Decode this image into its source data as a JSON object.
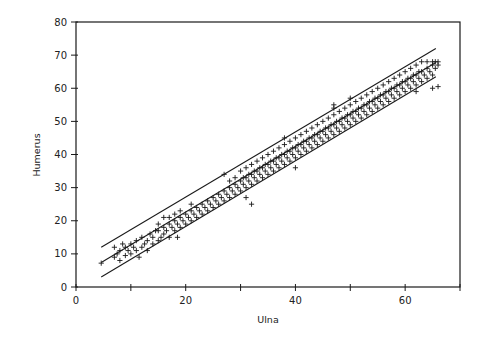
{
  "chart_data": {
    "type": "scatter",
    "title": "",
    "xlabel": "Ulna",
    "ylabel": "Humerus",
    "xlim": [
      0,
      70
    ],
    "ylim": [
      0,
      80
    ],
    "xticks": [
      0,
      10,
      20,
      30,
      40,
      50,
      60,
      70
    ],
    "xtick_labels": [
      "0",
      "",
      "20",
      "",
      "40",
      "",
      "60",
      ""
    ],
    "yticks": [
      0,
      10,
      20,
      30,
      40,
      50,
      60,
      70,
      80
    ],
    "ytick_labels": [
      "0",
      "10",
      "20",
      "30",
      "40",
      "50",
      "60",
      "70",
      "80"
    ],
    "grid": false,
    "legend": null,
    "marker": "+",
    "lines": [
      {
        "name": "regression-line",
        "x": [
          4.6,
          65.6
        ],
        "y": [
          7.4,
          67.8
        ]
      },
      {
        "name": "upper-band",
        "x": [
          4.6,
          65.6
        ],
        "y": [
          12.0,
          72.0
        ]
      },
      {
        "name": "lower-band",
        "x": [
          4.6,
          65.6
        ],
        "y": [
          3.0,
          63.5
        ]
      }
    ],
    "points": [
      [
        4.6,
        7.2
      ],
      [
        7,
        9
      ],
      [
        7,
        12
      ],
      [
        7.5,
        10
      ],
      [
        8,
        8
      ],
      [
        8,
        11
      ],
      [
        8.5,
        13
      ],
      [
        9,
        9.5
      ],
      [
        9,
        12
      ],
      [
        9.5,
        11
      ],
      [
        10,
        10
      ],
      [
        10,
        13
      ],
      [
        10.5,
        12
      ],
      [
        11,
        11
      ],
      [
        11,
        14
      ],
      [
        11.5,
        9
      ],
      [
        12,
        12
      ],
      [
        12,
        15
      ],
      [
        12.5,
        13
      ],
      [
        13,
        11
      ],
      [
        13,
        14
      ],
      [
        13.5,
        16
      ],
      [
        14,
        13
      ],
      [
        14,
        15
      ],
      [
        14.5,
        17
      ],
      [
        15,
        14
      ],
      [
        15,
        17
      ],
      [
        15,
        19
      ],
      [
        15.5,
        15
      ],
      [
        16,
        16
      ],
      [
        16,
        18
      ],
      [
        16,
        21
      ],
      [
        16.5,
        17
      ],
      [
        17,
        15
      ],
      [
        17,
        19
      ],
      [
        17,
        21
      ],
      [
        17.5,
        18
      ],
      [
        18,
        17
      ],
      [
        18,
        20
      ],
      [
        18,
        22
      ],
      [
        18.5,
        15
      ],
      [
        18.5,
        19
      ],
      [
        19,
        18
      ],
      [
        19,
        21
      ],
      [
        19,
        23
      ],
      [
        19.5,
        20
      ],
      [
        20,
        19
      ],
      [
        20,
        22
      ],
      [
        20.5,
        21
      ],
      [
        21,
        20
      ],
      [
        21,
        23
      ],
      [
        21,
        25
      ],
      [
        21.5,
        22
      ],
      [
        22,
        21
      ],
      [
        22,
        24
      ],
      [
        22.5,
        23
      ],
      [
        23,
        22
      ],
      [
        23,
        25
      ],
      [
        23.5,
        24
      ],
      [
        24,
        23
      ],
      [
        24,
        26
      ],
      [
        24.5,
        25
      ],
      [
        25,
        24
      ],
      [
        25,
        27
      ],
      [
        25.5,
        26
      ],
      [
        26,
        25
      ],
      [
        26,
        28
      ],
      [
        26.5,
        27
      ],
      [
        27,
        26
      ],
      [
        27,
        29
      ],
      [
        27,
        34
      ],
      [
        27.5,
        28
      ],
      [
        28,
        27
      ],
      [
        28,
        30
      ],
      [
        28,
        32
      ],
      [
        28.5,
        29
      ],
      [
        29,
        28
      ],
      [
        29,
        31
      ],
      [
        29,
        33
      ],
      [
        29.5,
        30
      ],
      [
        30,
        29
      ],
      [
        30,
        32
      ],
      [
        30,
        35
      ],
      [
        30.5,
        31
      ],
      [
        30.5,
        33
      ],
      [
        31,
        27
      ],
      [
        31,
        30
      ],
      [
        31,
        33
      ],
      [
        31,
        36
      ],
      [
        31.5,
        32
      ],
      [
        31.5,
        34
      ],
      [
        32,
        25
      ],
      [
        32,
        31
      ],
      [
        32,
        34
      ],
      [
        32,
        37
      ],
      [
        32.5,
        33
      ],
      [
        32.5,
        35
      ],
      [
        33,
        32
      ],
      [
        33,
        35
      ],
      [
        33,
        38
      ],
      [
        33.5,
        34
      ],
      [
        33.5,
        36
      ],
      [
        34,
        33
      ],
      [
        34,
        36
      ],
      [
        34,
        39
      ],
      [
        34.5,
        35
      ],
      [
        34.5,
        37
      ],
      [
        35,
        34
      ],
      [
        35,
        37
      ],
      [
        35,
        40
      ],
      [
        35.5,
        36
      ],
      [
        35.5,
        38
      ],
      [
        36,
        35
      ],
      [
        36,
        38
      ],
      [
        36,
        41
      ],
      [
        36.5,
        37
      ],
      [
        36.5,
        39
      ],
      [
        37,
        36
      ],
      [
        37,
        39
      ],
      [
        37,
        42
      ],
      [
        37.5,
        38
      ],
      [
        37.5,
        40
      ],
      [
        38,
        37
      ],
      [
        38,
        40
      ],
      [
        38,
        43
      ],
      [
        38,
        45
      ],
      [
        38.5,
        39
      ],
      [
        38.5,
        41
      ],
      [
        39,
        38
      ],
      [
        39,
        41
      ],
      [
        39,
        44
      ],
      [
        39.5,
        40
      ],
      [
        39.5,
        42
      ],
      [
        40,
        36
      ],
      [
        40,
        39
      ],
      [
        40,
        42
      ],
      [
        40,
        45
      ],
      [
        40.5,
        41
      ],
      [
        40.5,
        43
      ],
      [
        41,
        40
      ],
      [
        41,
        43
      ],
      [
        41,
        46
      ],
      [
        41.5,
        42
      ],
      [
        41.5,
        44
      ],
      [
        42,
        41
      ],
      [
        42,
        44
      ],
      [
        42,
        47
      ],
      [
        42.5,
        43
      ],
      [
        42.5,
        45
      ],
      [
        43,
        42
      ],
      [
        43,
        45
      ],
      [
        43,
        48
      ],
      [
        43.5,
        44
      ],
      [
        43.5,
        46
      ],
      [
        44,
        43
      ],
      [
        44,
        46
      ],
      [
        44,
        49
      ],
      [
        44.5,
        45
      ],
      [
        44.5,
        47
      ],
      [
        45,
        44
      ],
      [
        45,
        47
      ],
      [
        45,
        50
      ],
      [
        45.5,
        46
      ],
      [
        45.5,
        48
      ],
      [
        46,
        45
      ],
      [
        46,
        48
      ],
      [
        46,
        51
      ],
      [
        46.5,
        47
      ],
      [
        46.5,
        49
      ],
      [
        47,
        46
      ],
      [
        47,
        49
      ],
      [
        47,
        52
      ],
      [
        47,
        54
      ],
      [
        47,
        55
      ],
      [
        47.5,
        48
      ],
      [
        47.5,
        50
      ],
      [
        48,
        47
      ],
      [
        48,
        50
      ],
      [
        48,
        53
      ],
      [
        48.5,
        49
      ],
      [
        48.5,
        51
      ],
      [
        49,
        48
      ],
      [
        49,
        51
      ],
      [
        49,
        54
      ],
      [
        49.5,
        50
      ],
      [
        49.5,
        52
      ],
      [
        50,
        49
      ],
      [
        50,
        52
      ],
      [
        50,
        55
      ],
      [
        50,
        57
      ],
      [
        50.5,
        51
      ],
      [
        50.5,
        53
      ],
      [
        51,
        50
      ],
      [
        51,
        53
      ],
      [
        51,
        56
      ],
      [
        51.5,
        52
      ],
      [
        51.5,
        54
      ],
      [
        52,
        51
      ],
      [
        52,
        54
      ],
      [
        52,
        57
      ],
      [
        52.5,
        53
      ],
      [
        52.5,
        55
      ],
      [
        53,
        52
      ],
      [
        53,
        55
      ],
      [
        53,
        58
      ],
      [
        53.5,
        54
      ],
      [
        53.5,
        56
      ],
      [
        54,
        53
      ],
      [
        54,
        56
      ],
      [
        54,
        59
      ],
      [
        54.5,
        55
      ],
      [
        54.5,
        57
      ],
      [
        55,
        54
      ],
      [
        55,
        57
      ],
      [
        55,
        60
      ],
      [
        55.5,
        56
      ],
      [
        55.5,
        58
      ],
      [
        56,
        55
      ],
      [
        56,
        58
      ],
      [
        56,
        61
      ],
      [
        56.5,
        57
      ],
      [
        56.5,
        59
      ],
      [
        57,
        56
      ],
      [
        57,
        59
      ],
      [
        57,
        62
      ],
      [
        57.5,
        58
      ],
      [
        57.5,
        60
      ],
      [
        58,
        57
      ],
      [
        58,
        60
      ],
      [
        58,
        63
      ],
      [
        58.5,
        59
      ],
      [
        58.5,
        61
      ],
      [
        59,
        58
      ],
      [
        59,
        61
      ],
      [
        59,
        64
      ],
      [
        59.5,
        60
      ],
      [
        59.5,
        62
      ],
      [
        60,
        59
      ],
      [
        60,
        62
      ],
      [
        60,
        65
      ],
      [
        60.5,
        61
      ],
      [
        60.5,
        63
      ],
      [
        61,
        60
      ],
      [
        61,
        63
      ],
      [
        61,
        66
      ],
      [
        61.5,
        62
      ],
      [
        61.5,
        64
      ],
      [
        62,
        59
      ],
      [
        62,
        61
      ],
      [
        62,
        64
      ],
      [
        62,
        67
      ],
      [
        62.5,
        63
      ],
      [
        62.5,
        65
      ],
      [
        63,
        62
      ],
      [
        63,
        65
      ],
      [
        63,
        68
      ],
      [
        63.5,
        64
      ],
      [
        64,
        63
      ],
      [
        64,
        66
      ],
      [
        64,
        68
      ],
      [
        64.5,
        65
      ],
      [
        65,
        60
      ],
      [
        65,
        64
      ],
      [
        65,
        67
      ],
      [
        65,
        68
      ],
      [
        65.5,
        66
      ],
      [
        65.5,
        68
      ],
      [
        66,
        60.5
      ],
      [
        66,
        67
      ],
      [
        66,
        68
      ]
    ],
    "plot_area_px": {
      "left": 76,
      "top": 22,
      "right": 460,
      "bottom": 287
    }
  },
  "colors": {
    "ink": "#1a1a1a",
    "background": "#ffffff"
  }
}
